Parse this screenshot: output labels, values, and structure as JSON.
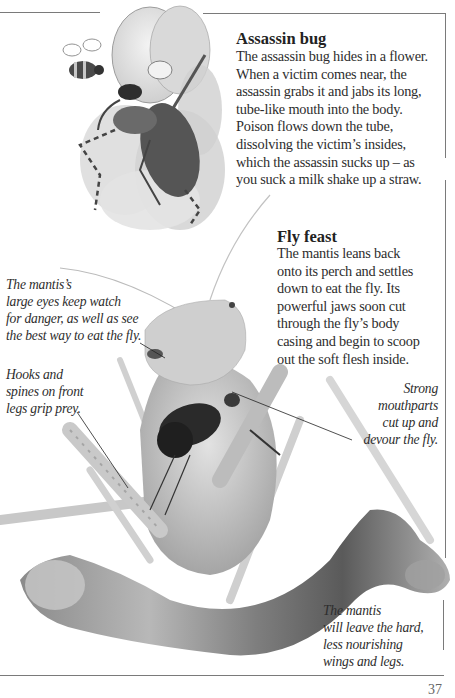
{
  "page": {
    "page_number": "37",
    "colors": {
      "text": "#2d2d2d",
      "frame": "#7a7a7a",
      "background": "#ffffff"
    }
  },
  "illustration": {
    "subject": "Assassin bug hiding in a flower with a bee flying nearby",
    "bee": "bee-icon",
    "bug": "assassin-bug-illustration"
  },
  "photo": {
    "subject": "Praying mantis eating a fly on a branch"
  },
  "sections": {
    "assassin_bug": {
      "heading": "Assassin bug",
      "body": "The assassin bug hides in a flower.\nWhen a victim comes near, the\nassassin grabs it and jabs its long,\ntube-like mouth into the body.\nPoison flows down the tube,\ndissolving the victim’s insides,\nwhich the assassin sucks up – as\nyou suck a milk shake up a straw."
    },
    "fly_feast": {
      "heading": "Fly feast",
      "body": "The mantis leans back\nonto its perch and settles\ndown to eat the fly. Its\npowerful jaws soon cut\nthrough the fly’s body\ncasing and begin to scoop\nout the soft flesh inside."
    }
  },
  "captions": {
    "eyes": "The mantis’s\nlarge eyes keep watch\nfor danger, as well as see\nthe best way to eat the fly.",
    "hooks": "Hooks and\nspines on front\nlegs grip prey.",
    "mouthparts": "Strong\nmouthparts\ncut up and\ndevour the fly.",
    "leave": "The mantis\nwill leave the hard,\nless nourishing\nwings and legs."
  }
}
